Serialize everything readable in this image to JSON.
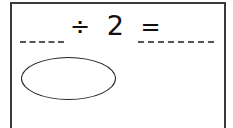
{
  "worksheet": {
    "equation": {
      "operator": "÷",
      "divisor": "2",
      "equals": "="
    },
    "blanks": {
      "dividend": "",
      "quotient": ""
    },
    "answer_ellipse": ""
  }
}
